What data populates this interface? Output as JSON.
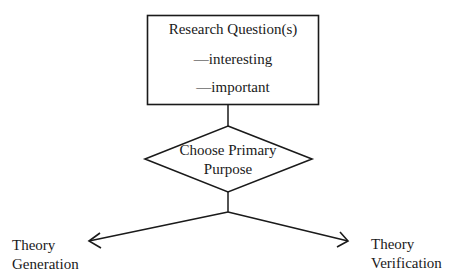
{
  "diagram": {
    "research_box": {
      "title": "Research Question(s)",
      "items": [
        "—interesting",
        "—important"
      ]
    },
    "decision": {
      "line1": "Choose Primary",
      "line2": "Purpose"
    },
    "outcomes": {
      "left": {
        "line1": "Theory",
        "line2": "Generation"
      },
      "right": {
        "line1": "Theory",
        "line2": "Verification"
      }
    },
    "colors": {
      "stroke": "#1a1a1a",
      "background": "#ffffff"
    }
  }
}
